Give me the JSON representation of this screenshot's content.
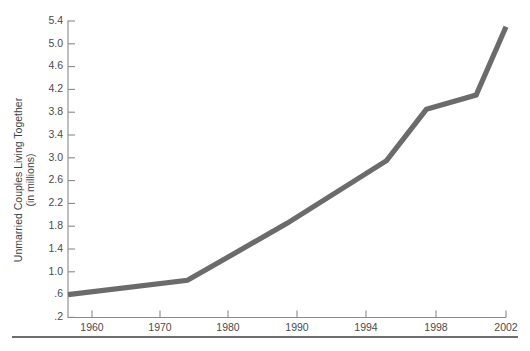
{
  "chart_data": {
    "type": "line",
    "title": "",
    "subtitle": "",
    "xlabel": "",
    "ylabel": "Unmarried Couples Living Together (in millions)",
    "ylabel_line1": "Unmarried Couples Living Together",
    "ylabel_line2": "(in millions)",
    "grid": false,
    "legend": "none",
    "xlim": [
      1958,
      2002
    ],
    "ylim": [
      0.2,
      5.4
    ],
    "x_tick_labels": [
      "1960",
      "1970",
      "1980",
      "1990",
      "1994",
      "1998",
      "2002"
    ],
    "x_ticks": [
      1960,
      1970,
      1980,
      1990,
      1994,
      1998,
      2002
    ],
    "y_tick_labels": [
      ".2",
      ".6",
      "1.0",
      "1.4",
      "1.8",
      "2.2",
      "2.6",
      "3.0",
      "3.4",
      "3.8",
      "4.2",
      "4.6",
      "5.0",
      "5.4"
    ],
    "y_ticks": [
      0.2,
      0.6,
      1.0,
      1.4,
      1.8,
      2.2,
      2.6,
      3.0,
      3.4,
      3.8,
      4.2,
      4.6,
      5.0,
      5.4
    ],
    "series": [
      {
        "name": "Unmarried Couples Living Together",
        "color": "#6b6b6b",
        "x": [
          1958,
          1970,
          1980,
          1990,
          1994,
          1999,
          2002
        ],
        "values": [
          0.6,
          0.85,
          1.85,
          2.95,
          3.85,
          4.1,
          5.3
        ]
      }
    ],
    "annotations": [],
    "colors": {
      "line": "#6b6b6b",
      "axis": "#8a8a8a",
      "text": "#3f3f3f",
      "rule": "#3c3c3c",
      "background": "#ffffff"
    }
  },
  "footer_rule": {
    "present": true
  }
}
